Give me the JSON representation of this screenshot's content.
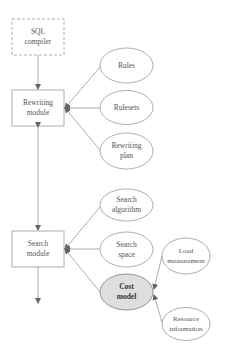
{
  "diagram": {
    "nodes": {
      "sql_compiler": {
        "line1": "SQL",
        "line2": "compiler",
        "shape": "dashed-rect"
      },
      "rewriting_module": {
        "line1": "Rewriting",
        "line2": "module",
        "shape": "rect"
      },
      "search_module": {
        "line1": "Search",
        "line2": "module",
        "shape": "rect"
      },
      "rules": {
        "line1": "Rules",
        "shape": "ellipse"
      },
      "rulesets": {
        "line1": "Rulesets",
        "shape": "ellipse"
      },
      "rewriting_plan": {
        "line1": "Rewriting",
        "line2": "plan",
        "shape": "ellipse"
      },
      "search_algorithm": {
        "line1": "Search",
        "line2": "algorithm",
        "shape": "ellipse"
      },
      "search_space": {
        "line1": "Search",
        "line2": "space",
        "shape": "ellipse"
      },
      "cost_model": {
        "line1": "Cost",
        "line2": "model",
        "shape": "ellipse",
        "highlighted": true,
        "fill": "#dedede"
      },
      "load_measurement": {
        "line1": "Load",
        "line2": "measurement",
        "shape": "ellipse"
      },
      "resource_information": {
        "line1": "Resource",
        "line2": "information",
        "shape": "ellipse"
      }
    },
    "edges": [
      {
        "from": "sql_compiler",
        "to": "rewriting_module"
      },
      {
        "from": "rules",
        "to": "rewriting_module"
      },
      {
        "from": "rulesets",
        "to": "rewriting_module"
      },
      {
        "from": "rewriting_plan",
        "to": "rewriting_module"
      },
      {
        "from": "rewriting_module",
        "to": "search_module",
        "bidirectional": true
      },
      {
        "from": "search_algorithm",
        "to": "search_module"
      },
      {
        "from": "search_space",
        "to": "search_module"
      },
      {
        "from": "cost_model",
        "to": "search_module"
      },
      {
        "from": "load_measurement",
        "to": "cost_model"
      },
      {
        "from": "resource_information",
        "to": "cost_model"
      },
      {
        "from": "search_module",
        "to": "output"
      }
    ],
    "colors": {
      "stroke": "#8a8a8a",
      "text": "#555555",
      "highlight_fill": "#dedede"
    }
  }
}
